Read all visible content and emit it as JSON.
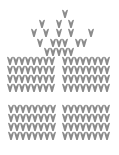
{
  "image": {
    "subject": "knitted gift box",
    "stitch_color": "#8c8c8c",
    "background": "#ffffff"
  },
  "bow_stitches": [
    [
      62,
      10
    ],
    [
      39,
      20
    ],
    [
      56,
      20
    ],
    [
      68,
      20
    ],
    [
      31,
      29
    ],
    [
      43,
      29
    ],
    [
      56,
      29
    ],
    [
      68,
      29
    ],
    [
      88,
      29
    ],
    [
      37,
      39
    ],
    [
      50,
      39
    ],
    [
      56,
      39
    ],
    [
      62,
      39
    ],
    [
      75,
      39
    ],
    [
      81,
      39
    ],
    [
      44,
      48
    ],
    [
      50,
      48
    ],
    [
      56,
      48
    ],
    [
      62,
      48
    ],
    [
      68,
      48
    ]
  ],
  "box_blocks": [
    {
      "name": "lid-left",
      "x0": 7,
      "y0": 57,
      "cols": 8,
      "rows": 4
    },
    {
      "name": "lid-right",
      "x0": 62,
      "y0": 57,
      "cols": 8,
      "rows": 4
    },
    {
      "name": "base-left",
      "x0": 8,
      "y0": 105,
      "cols": 8,
      "rows": 4
    },
    {
      "name": "base-right",
      "x0": 62,
      "y0": 105,
      "cols": 8,
      "rows": 4
    }
  ],
  "stitch": {
    "w": 6,
    "h": 8,
    "pitch_x": 6,
    "pitch_y": 9
  }
}
